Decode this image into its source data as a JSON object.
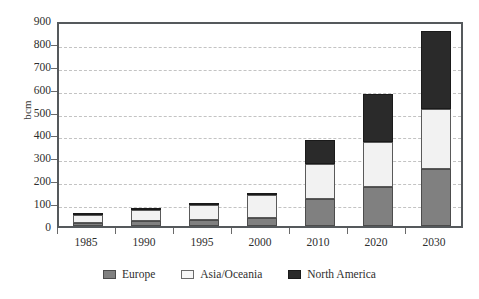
{
  "chart_data": {
    "type": "bar",
    "stacked": true,
    "title": "",
    "xlabel": "",
    "ylabel": "bcm",
    "ylim": [
      0,
      900
    ],
    "ytick_step": 100,
    "yticks": [
      "900",
      "800",
      "700",
      "600",
      "500",
      "400",
      "300",
      "200",
      "100",
      "0"
    ],
    "grid": true,
    "grid_style": "dashed-horizontal",
    "legend_position": "bottom-center",
    "categories": [
      "1985",
      "1990",
      "1995",
      "2000",
      "2010",
      "2020",
      "2030"
    ],
    "series": [
      {
        "name": "Europe",
        "color": "#808080",
        "values": [
          15,
          22,
          28,
          36,
          120,
          170,
          250
        ]
      },
      {
        "name": "Asia/Oceania",
        "color": "#f2f2f2",
        "values": [
          35,
          48,
          65,
          100,
          152,
          195,
          260
        ]
      },
      {
        "name": "North America",
        "color": "#2a2a2a",
        "values": [
          2,
          3,
          4,
          8,
          103,
          210,
          340
        ]
      }
    ],
    "totals": [
      52,
      73,
      97,
      144,
      375,
      575,
      850
    ]
  },
  "legend": {
    "items": [
      {
        "label": "Europe",
        "swatch": "europe-swatch"
      },
      {
        "label": "Asia/Oceania",
        "swatch": "asia-oceania-swatch"
      },
      {
        "label": "North America",
        "swatch": "north-america-swatch"
      }
    ]
  },
  "colors": {
    "europe": "#808080",
    "asia_oceania": "#f2f2f2",
    "north_america": "#2a2a2a",
    "axis": "#55595c",
    "gridline": "#c3c3c3",
    "background": "#ffffff"
  }
}
